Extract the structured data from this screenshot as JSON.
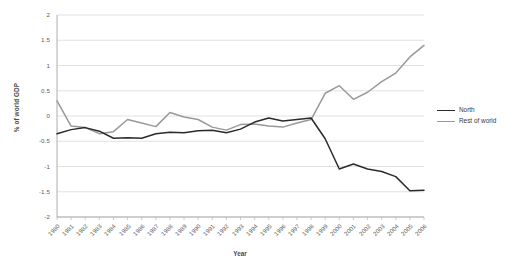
{
  "chart_data": {
    "type": "line",
    "title": "",
    "xlabel": "Year",
    "ylabel": "% of world GDP",
    "grid": "horizontal",
    "legend_position": "right",
    "xlim": [
      1980,
      2006
    ],
    "ylim": [
      -2,
      2
    ],
    "ytick_labels": [
      "2",
      "1.5",
      "1",
      "0.5",
      "0",
      "-0.5",
      "-1",
      "-1.5",
      "-2"
    ],
    "ytick_values": [
      2,
      1.5,
      1,
      0.5,
      0,
      -0.5,
      -1,
      -1.5,
      -2
    ],
    "categories": [
      "1980",
      "1981",
      "1982",
      "1983",
      "1984",
      "1985",
      "1986",
      "1987",
      "1988",
      "1989",
      "1990",
      "1991",
      "1992",
      "1993",
      "1994",
      "1995",
      "1996",
      "1997",
      "1998",
      "1999",
      "2000",
      "2001",
      "2002",
      "2003",
      "2004",
      "2005",
      "2006"
    ],
    "x": [
      1980,
      1981,
      1982,
      1983,
      1984,
      1985,
      1986,
      1987,
      1988,
      1989,
      1990,
      1991,
      1992,
      1993,
      1994,
      1995,
      1996,
      1997,
      1998,
      1999,
      2000,
      2001,
      2002,
      2003,
      2004,
      2005,
      2006
    ],
    "series": [
      {
        "name": "North",
        "color": "#2b2b2b",
        "values": [
          -0.35,
          -0.27,
          -0.23,
          -0.3,
          -0.44,
          -0.43,
          -0.44,
          -0.35,
          -0.32,
          -0.33,
          -0.29,
          -0.28,
          -0.33,
          -0.26,
          -0.12,
          -0.04,
          -0.1,
          -0.07,
          -0.04,
          -0.45,
          -1.05,
          -0.95,
          -1.05,
          -1.1,
          -1.2,
          -1.48,
          -1.47
        ]
      },
      {
        "name": "Rest of world",
        "color": "#999999",
        "values": [
          0.3,
          -0.2,
          -0.23,
          -0.35,
          -0.31,
          -0.07,
          -0.14,
          -0.21,
          0.07,
          -0.02,
          -0.07,
          -0.22,
          -0.28,
          -0.17,
          -0.16,
          -0.2,
          -0.22,
          -0.14,
          -0.07,
          0.45,
          0.6,
          0.33,
          0.47,
          0.68,
          0.85,
          1.17,
          1.4
        ]
      }
    ]
  },
  "legend": {
    "items": [
      {
        "label": "North"
      },
      {
        "label": "Rest of world"
      }
    ]
  }
}
